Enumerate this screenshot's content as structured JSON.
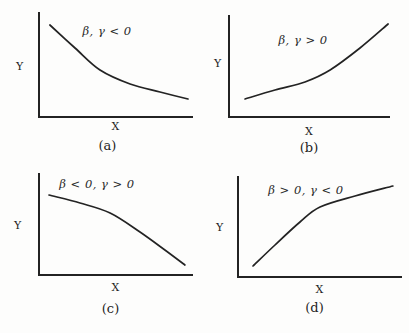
{
  "figure": {
    "background": "#fdfdfc",
    "ink_color": "#232323",
    "panel_count": 4
  },
  "chart_data": [
    {
      "panel": "a",
      "type": "line",
      "caption": "(a)",
      "xlabel": "X",
      "ylabel": "Y",
      "annotation": "β, γ < 0",
      "trend": "decreasing, convex (steep then flattening)",
      "x_range": [
        0,
        1
      ],
      "y_range": [
        0,
        1
      ],
      "points": [
        [
          0.077,
          0.877
        ],
        [
          0.239,
          0.66
        ],
        [
          0.4,
          0.453
        ],
        [
          0.594,
          0.321
        ],
        [
          0.787,
          0.245
        ],
        [
          0.968,
          0.179
        ]
      ]
    },
    {
      "panel": "b",
      "type": "line",
      "caption": "(b)",
      "xlabel": "X",
      "ylabel": "Y",
      "annotation": "β, γ > 0",
      "trend": "increasing, convex (shallow then steepening)",
      "x_range": [
        0,
        1
      ],
      "y_range": [
        0,
        1
      ],
      "points": [
        [
          0.105,
          0.184
        ],
        [
          0.29,
          0.272
        ],
        [
          0.475,
          0.35
        ],
        [
          0.63,
          0.466
        ],
        [
          0.815,
          0.68
        ],
        [
          0.988,
          0.913
        ]
      ]
    },
    {
      "panel": "c",
      "type": "line",
      "caption": "(c)",
      "xlabel": "X",
      "ylabel": "Y",
      "annotation": "β < 0, γ > 0",
      "trend": "decreasing, concave (shallow then steepening downward)",
      "x_range": [
        0,
        1
      ],
      "y_range": [
        0,
        1
      ],
      "points": [
        [
          0.071,
          0.786
        ],
        [
          0.271,
          0.709
        ],
        [
          0.465,
          0.612
        ],
        [
          0.658,
          0.427
        ],
        [
          0.819,
          0.252
        ],
        [
          0.948,
          0.107
        ]
      ]
    },
    {
      "panel": "d",
      "type": "line",
      "caption": "(d)",
      "xlabel": "X",
      "ylabel": "Y",
      "annotation": "β > 0, γ < 0",
      "trend": "increasing, concave (steep then flattening)",
      "x_range": [
        0,
        1
      ],
      "y_range": [
        0,
        1
      ],
      "points": [
        [
          0.097,
          0.118
        ],
        [
          0.23,
          0.324
        ],
        [
          0.382,
          0.549
        ],
        [
          0.503,
          0.696
        ],
        [
          0.715,
          0.804
        ],
        [
          0.945,
          0.902
        ]
      ]
    }
  ]
}
